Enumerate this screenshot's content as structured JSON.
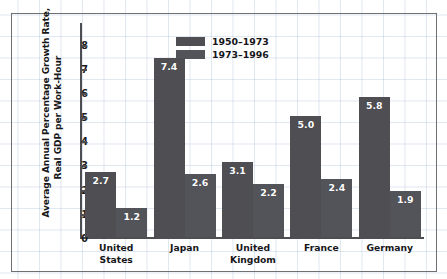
{
  "chart_data": {
    "type": "bar",
    "title": "",
    "xlabel": "",
    "ylabel": "Average Annual Percentage Growth Rate, Real GDP per Work-Hour",
    "ylabel_lines": [
      "Average Annual Percentage Growth Rate,",
      "Real GDP per Work-Hour"
    ],
    "ylim": [
      0,
      8.6
    ],
    "yticks": [
      "0",
      "1",
      "2",
      "3",
      "4",
      "5",
      "6",
      "7",
      "8"
    ],
    "ytick_values": [
      0,
      1,
      2,
      3,
      4,
      5,
      6,
      7,
      8
    ],
    "grid": true,
    "legend_position": "top-center",
    "categories": [
      "United States",
      "Japan",
      "United Kingdom",
      "France",
      "Germany"
    ],
    "category_lines": [
      [
        "United",
        "States"
      ],
      [
        "Japan"
      ],
      [
        "United",
        "Kingdom"
      ],
      [
        "France"
      ],
      [
        "Germany"
      ]
    ],
    "series": [
      {
        "name": "1950–1973",
        "color": "#4e4e53",
        "values": [
          2.7,
          7.4,
          3.1,
          5.0,
          5.8
        ],
        "labels": [
          "2.7",
          "7.4",
          "3.1",
          "5.0",
          "5.8"
        ]
      },
      {
        "name": "1973–1996",
        "color": "#53535a",
        "values": [
          1.2,
          2.6,
          2.2,
          2.4,
          1.9
        ],
        "labels": [
          "1.2",
          "2.6",
          "2.2",
          "2.4",
          "1.9"
        ]
      }
    ]
  },
  "legend": {
    "items": [
      {
        "label": "1950–1973",
        "color": "#4e4e53"
      },
      {
        "label": "1973–1996",
        "color": "#53535a"
      }
    ]
  },
  "colors": {
    "bar": "#4e4e53",
    "axis": "#4d4d52",
    "text": "#17171a",
    "label_text": "#ffffff",
    "frame": "#6f6f74",
    "grid": "#b0c4de"
  }
}
